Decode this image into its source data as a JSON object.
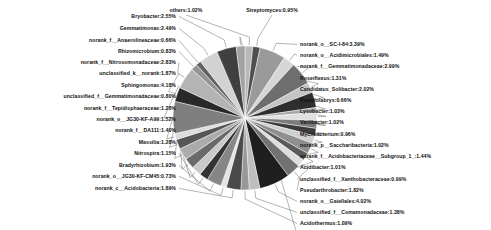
{
  "chart_data": {
    "type": "pie",
    "title": "",
    "subtitle": "",
    "xlabel": "",
    "ylabel": "",
    "legend_position": "none",
    "grid": false,
    "value_unit": "percent",
    "label_format": "name:value%",
    "categories": [
      "others",
      "Streptomyces",
      "norank_o__SC-I-84",
      "norank_o__Acidimicrobiales",
      "norank_f__Gemmatimonadaceae",
      "Roseiflexus",
      "Candidatus_Solibacter",
      "Pseudolabrys",
      "Lysobacter",
      "Variibacter",
      "Mycobacterium",
      "norank_p__Saccharibacteria",
      "norank_f__Acidobacteriaceae__Subgroup_1_",
      "Acidibacter",
      "unclassified_f__Xanthobacteraceae",
      "Pseudarthrobacter",
      "norank_o__Gaiellales",
      "unclassified_f__Comamonadaceae",
      "Acidothermus",
      "norank_c__Acidobacteria",
      "norank_o__JG30-KF-CM45",
      "Bradyrhizobium",
      "Nitrospira",
      "Massilia",
      "norank_f__DA111",
      "norank_o__JG30-KF-A99",
      "norank_f__Tepidisphaeraceae",
      "unclassified_f__Gemmatimonadaceae",
      "Sphingomonas",
      "unclassified_k__norank",
      "norank_f__Nitrosomonadaceae",
      "Rhizomicrobium",
      "norank_f__Anaerolineaceae",
      "Gemmatimonas",
      "Bryobacter",
      "Rhodanobacter"
    ],
    "values": [
      1.02,
      0.95,
      3.39,
      1.49,
      2.99,
      1.31,
      2.02,
      0.66,
      1.03,
      1.02,
      0.96,
      1.02,
      1.44,
      1.01,
      0.99,
      1.82,
      4.02,
      1.38,
      1.09,
      1.89,
      0.73,
      1.93,
      1.15,
      1.28,
      1.4,
      1.52,
      1.28,
      0.8,
      4.18,
      1.87,
      2.83,
      0.83,
      0.66,
      2.49,
      2.55,
      1.14
    ],
    "labels": [
      "others:1.02%",
      "Streptomyces:0.95%",
      "norank_o__SC-I-84:3.39%",
      "norank_o__Acidimicrobiales:1.49%",
      "norank_f__Gemmatimonadaceae:2.99%",
      "Roseiflexus:1.31%",
      "Candidatus_Solibacter:2.02%",
      "Pseudolabrys:0.66%",
      "Lysobacter:1.03%",
      "Variibacter:1.02%",
      "Mycobacterium:0.96%",
      "norank_p__Saccharibacteria:1.02%",
      "norank_f__Acidobacteriaceae__Subgroup_1_:1.44%",
      "Acidibacter:1.01%",
      "unclassified_f__Xanthobacteraceae:0.99%",
      "Pseudarthrobacter:1.82%",
      "norank_o__Gaiellales:4.02%",
      "unclassified_f__Comamonadaceae:1.38%",
      "Acidothermus:1.09%",
      "norank_c__Acidobacteria:1.89%",
      "norank_o__JG30-KF-CM45:0.73%",
      "Bradyrhizobium:1.93%",
      "Nitrospira:1.15%",
      "Massilia:1.28%",
      "norank_f__DA111:1.40%",
      "norank_o__JG30-KF-A99:1.52%",
      "norank_f__Tepidisphaeraceae:1.28%",
      "unclassified_f__Gemmatimonadaceae:0.80%",
      "Sphingomonas:4.18%",
      "unclassified_k__norank:1.87%",
      "norank_f__Nitrosomonadaceae:2.83%",
      "Rhizomicrobium:0.83%",
      "norank_f__Anaerolineaceae:0.66%",
      "Gemmatimonas:2.49%",
      "Bryobacter:2.55%",
      "Rhodanobacter:1.14%"
    ],
    "colors": [
      "#b8b8b8",
      "#4f4f4f",
      "#9a9a9a",
      "#d6d6d6",
      "#6e6e6e",
      "#c4c4c4",
      "#2e2e2e",
      "#a8a8a8",
      "#e0e0e0",
      "#7b7b7b",
      "#3b3b3b",
      "#cfcfcf",
      "#8f8f8f",
      "#5a5a5a",
      "#dedede",
      "#727272",
      "#1f1f1f",
      "#bdbdbd",
      "#989898",
      "#4a4a4a",
      "#e4e4e4",
      "#868686",
      "#333333",
      "#c9c9c9",
      "#6a6a6a",
      "#ababab",
      "#565656",
      "#dcdcdc",
      "#7f7f7f",
      "#292929",
      "#b4b4b4",
      "#949494",
      "#616161",
      "#d2d2d2",
      "#404040",
      "#a2a2a2"
    ]
  },
  "figure": {
    "background_color": "#ffffff",
    "leader_line_color": "#6a6a6a",
    "label_text_color": "#111111",
    "center_x": 245,
    "center_y": 118,
    "radius": 72,
    "start_angle_deg": 90,
    "direction": "clockwise"
  }
}
